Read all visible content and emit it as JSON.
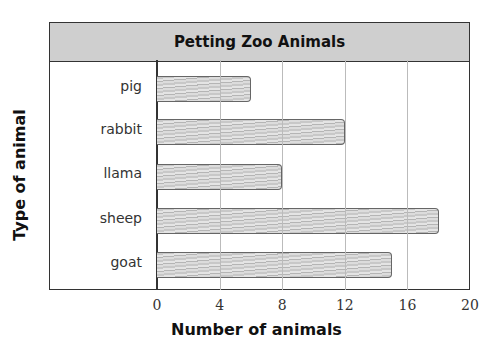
{
  "chart_data": {
    "type": "bar",
    "orientation": "horizontal",
    "title": "Petting Zoo Animals",
    "xlabel": "Number of animals",
    "ylabel": "Type of animal",
    "categories": [
      "pig",
      "rabbit",
      "llama",
      "sheep",
      "goat"
    ],
    "values": [
      6,
      12,
      8,
      18,
      15
    ],
    "xlim": [
      0,
      20
    ],
    "xticks": [
      "0",
      "4",
      "8",
      "12",
      "16",
      "20"
    ],
    "grid": true,
    "style": "hand-shaded pencil bars"
  }
}
